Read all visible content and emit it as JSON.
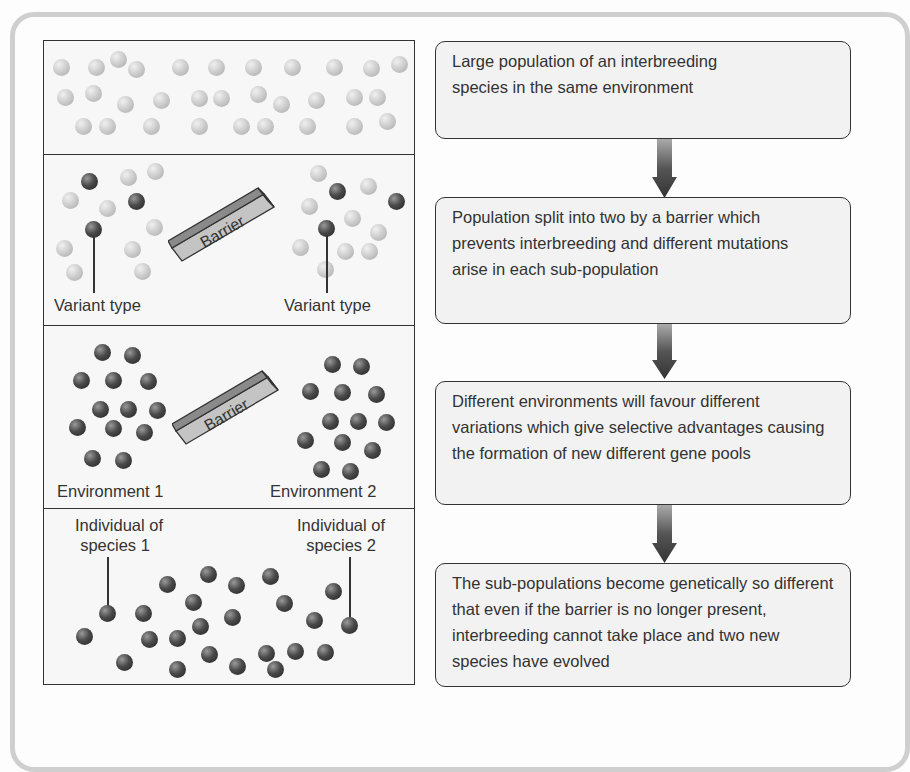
{
  "diagram": {
    "colors": {
      "light_ball": "#c8c8c8",
      "dark_ball": "#3a3a3a",
      "box_fill": "#f2f2f2",
      "border": "#333333"
    },
    "left_panel": {
      "stage1": {
        "description": "Mixed population of light individuals"
      },
      "stage2": {
        "barrier_label": "Barrier",
        "left_label": "Variant type",
        "right_label": "Variant type"
      },
      "stage3": {
        "barrier_label": "Barrier",
        "left_label": "Environment 1",
        "right_label": "Environment 2"
      },
      "stage4": {
        "left_label_line1": "Individual of",
        "left_label_line2": "species 1",
        "right_label_line1": "Individual of",
        "right_label_line2": "species 2"
      }
    },
    "flow_steps": [
      {
        "text": "Large population of an interbreeding species in the same environment"
      },
      {
        "text": "Population split into two by a barrier which prevents interbreeding and different mutations arise in each sub-population"
      },
      {
        "text": "Different environments will favour different variations which give selective advantages causing the formation of new different gene pools"
      },
      {
        "text": "The sub-populations become genetically so different that even if the barrier is no longer present, interbreeding cannot take place and two new species have evolved"
      }
    ],
    "arrows": [
      "down-arrow",
      "down-arrow",
      "down-arrow"
    ]
  }
}
